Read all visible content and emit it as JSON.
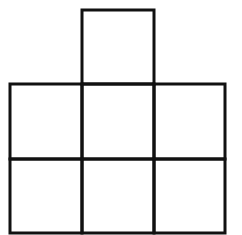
{
  "diagram": {
    "type": "grid-net",
    "stroke_color": "#111111",
    "background": "#ffffff",
    "stroke_width": 3,
    "cells": [
      {
        "id": "top-center",
        "x": 82,
        "y": 10,
        "w": 72,
        "h": 74
      },
      {
        "id": "mid-left",
        "x": 10,
        "y": 84,
        "w": 72,
        "h": 75
      },
      {
        "id": "mid-center",
        "x": 82,
        "y": 84,
        "w": 72,
        "h": 75
      },
      {
        "id": "mid-right",
        "x": 154,
        "y": 84,
        "w": 71,
        "h": 75
      },
      {
        "id": "bottom-left",
        "x": 10,
        "y": 159,
        "w": 72,
        "h": 74
      },
      {
        "id": "bottom-center",
        "x": 82,
        "y": 159,
        "w": 72,
        "h": 74
      },
      {
        "id": "bottom-right",
        "x": 154,
        "y": 159,
        "w": 71,
        "h": 74
      }
    ]
  }
}
